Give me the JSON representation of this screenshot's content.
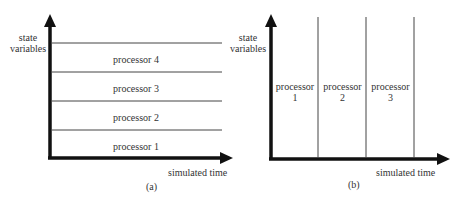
{
  "panel_a": {
    "y_axis_label_line1": "state",
    "y_axis_label_line2": "variables",
    "x_axis_label": "simulated time",
    "caption": "(a)",
    "bands": [
      {
        "label": "processor 4"
      },
      {
        "label": "processor 3"
      },
      {
        "label": "processor 2"
      },
      {
        "label": "processor 1"
      }
    ]
  },
  "panel_b": {
    "y_axis_label_line1": "state",
    "y_axis_label_line2": "variables",
    "x_axis_label": "simulated time",
    "caption": "(b)",
    "columns": [
      {
        "label_line1": "processor",
        "label_line2": "1"
      },
      {
        "label_line1": "processor",
        "label_line2": "2"
      },
      {
        "label_line1": "processor",
        "label_line2": "3"
      }
    ]
  },
  "colors": {
    "axis": "#111111",
    "divider": "#444444"
  }
}
